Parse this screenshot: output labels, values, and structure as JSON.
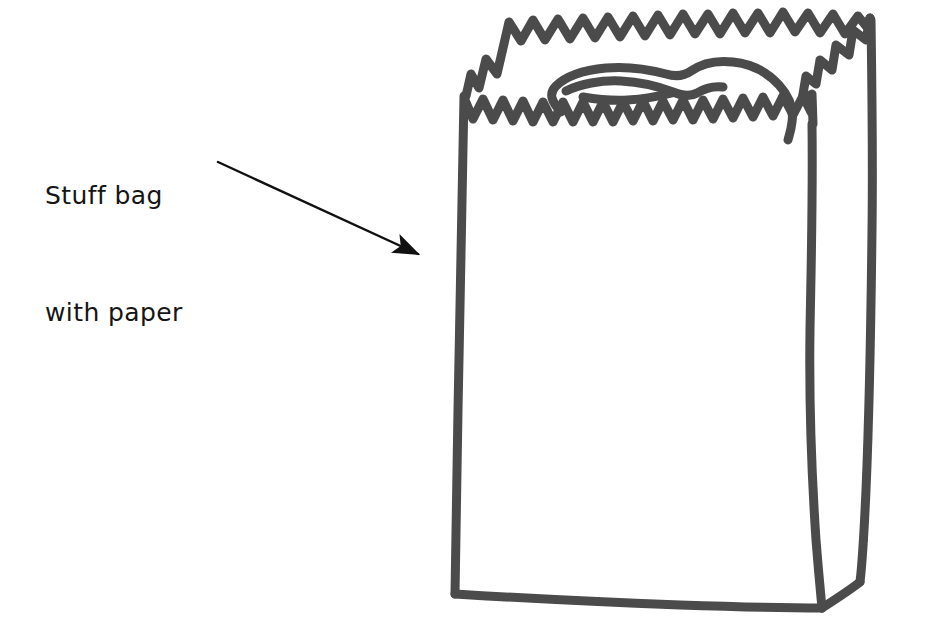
{
  "canvas": {
    "width": 932,
    "height": 628,
    "background": "#ffffff"
  },
  "annotation": {
    "name": "stuff-bag-with-paper-label",
    "line1": "Stuff bag",
    "line2": "with paper",
    "text_color": "#151515",
    "font_size_px": 25
  },
  "arrow": {
    "name": "pointer-arrow",
    "color": "#111111",
    "start_x": 218,
    "start_y": 162,
    "end_x": 428,
    "end_y": 259,
    "stroke_width": 2.4,
    "head_length": 26,
    "head_width": 13
  },
  "illustration": {
    "name": "paper-bag-drawing",
    "ink_color": "#4b4b4b",
    "stroke_width": 9,
    "description": "Hand drawn paper grocery bag seen in three-quarter view with serrated torn top edge and crumpled paper visible inside the opening",
    "parts": [
      {
        "name": "bag-front-face",
        "label": "front panel"
      },
      {
        "name": "bag-side-panel",
        "label": "right side panel"
      },
      {
        "name": "bag-front-zigzag-edge",
        "label": "front serrated rim"
      },
      {
        "name": "bag-back-zigzag-edge",
        "label": "back serrated rim"
      },
      {
        "name": "bag-side-zigzag-edge",
        "label": "side serrated rim"
      },
      {
        "name": "crumpled-paper-scribble",
        "label": "paper stuffed inside"
      },
      {
        "name": "bag-bottom-edge",
        "label": "bottom edge"
      }
    ]
  }
}
